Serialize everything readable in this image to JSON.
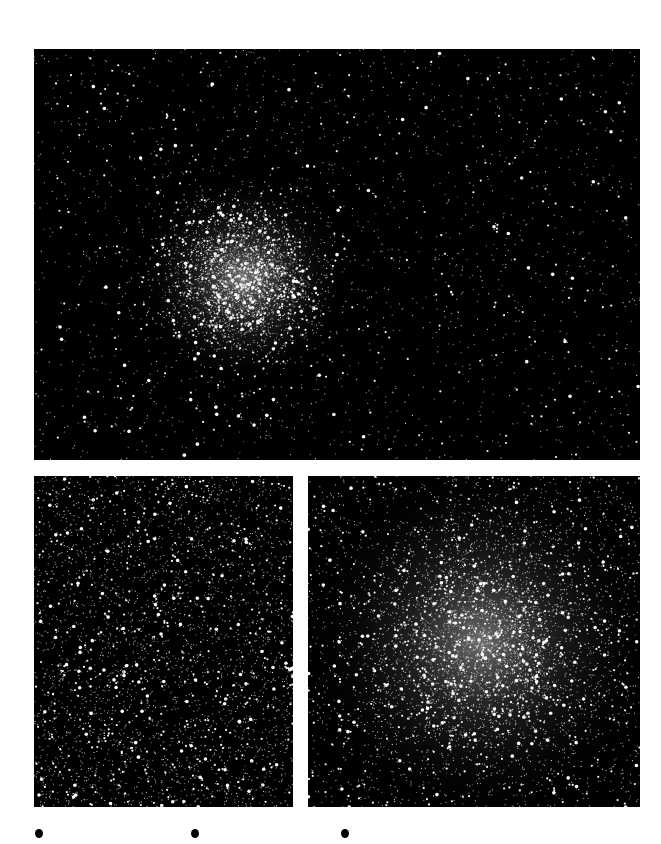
{
  "figure": {
    "panels": [
      {
        "id": "top",
        "name": "wide-field-cluster-image",
        "alt": "Globular cluster, wide field view",
        "cluster_center": [
          0.345,
          0.56
        ],
        "core_radius": 0.1,
        "star_count": 5000,
        "seed": 7
      },
      {
        "id": "bl",
        "name": "outer-field-image",
        "alt": "Dense star field, outer region",
        "cluster_center": [
          0.5,
          0.5
        ],
        "core_radius": 0,
        "star_count": 3500,
        "seed": 11
      },
      {
        "id": "br",
        "name": "cluster-core-image",
        "alt": "Globular cluster core close-up",
        "cluster_center": [
          0.52,
          0.5
        ],
        "core_radius": 0.3,
        "star_count": 5500,
        "seed": 23
      }
    ],
    "bullets": [
      {
        "x": 35
      },
      {
        "x": 191
      },
      {
        "x": 341
      }
    ],
    "colors": {
      "background": "#ffffff",
      "panel": "#000000",
      "bullet": "#000000"
    }
  }
}
